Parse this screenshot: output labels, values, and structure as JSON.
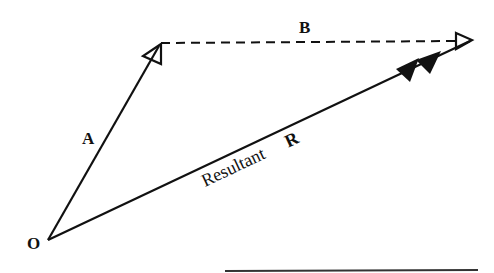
{
  "diagram": {
    "type": "vector-addition-triangle",
    "labels": {
      "origin": "O",
      "vector_a": "A",
      "vector_b": "B",
      "resultant_word": "Resultant",
      "resultant_symbol": "R"
    },
    "colors": {
      "stroke": "#111111",
      "background": "#ffffff"
    },
    "points": {
      "O": [
        48,
        240
      ],
      "A_tip": [
        160,
        44
      ],
      "B_tip": [
        472,
        40
      ]
    }
  }
}
